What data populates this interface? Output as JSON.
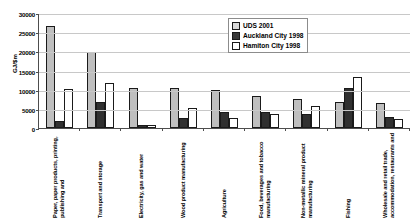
{
  "chart_data": {
    "type": "bar",
    "title": "",
    "xlabel": "",
    "ylabel": "GJ/$m",
    "ylim": [
      0,
      30000
    ],
    "ytick_values": [
      30000,
      25000,
      20000,
      15000,
      10000,
      5000,
      0
    ],
    "ytick_labels": [
      "30000",
      "25000",
      "20000",
      "15000",
      "10000",
      "5000",
      "0"
    ],
    "grid": true,
    "legend_position": "top-right",
    "categories": [
      "Paper, paper products, printing, publishing and",
      "Transport and storage",
      "Electricity, gas and water",
      "Wood product manufacturing",
      "Agriculture",
      "Food, beverages and tobacco manufacturing",
      "Non-metallic mineral product manufacturing",
      "Fishing",
      "Wholesale and retail trade, accommodation, restaurants and"
    ],
    "series": [
      {
        "name": "UDS 2001",
        "color": "#bfbfbf",
        "values": [
          26600,
          19900,
          10500,
          10400,
          9800,
          8400,
          7500,
          6700,
          6400
        ]
      },
      {
        "name": "Auckland City 1998",
        "color": "#303030",
        "values": [
          1700,
          6800,
          700,
          2700,
          4300,
          4100,
          3600,
          10400,
          3000
        ]
      },
      {
        "name": "Hamiton City 1998",
        "color": "#ffffff",
        "values": [
          10100,
          11700,
          800,
          5100,
          2700,
          3700,
          5800,
          13200,
          2300
        ]
      }
    ]
  },
  "legend": {
    "items": [
      {
        "label": "UDS 2001"
      },
      {
        "label": "Auckland City 1998"
      },
      {
        "label": "Hamiton City 1998"
      }
    ]
  }
}
